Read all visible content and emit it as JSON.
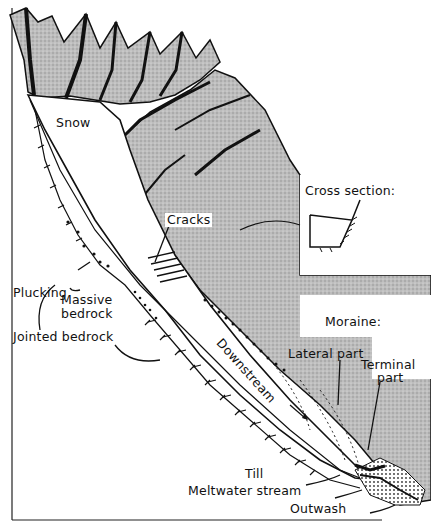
{
  "figure": {
    "colors": {
      "ink": "#111111",
      "rock_fill": "#b8b8b8",
      "rock_dark": "#8a8a8a",
      "snow": "#ffffff",
      "outwash_fill": "#d9d9d9"
    }
  },
  "labels": {
    "snow": "Snow",
    "cross_section": "Cross section:",
    "cracks": "Cracks",
    "plucking": "Plucking",
    "massive_bedrock_1": "Massive",
    "massive_bedrock_2": "bedrock",
    "jointed_bedrock": "Jointed bedrock",
    "moraine": "Moraine:",
    "lateral_part": "Lateral part",
    "terminal_part_1": "Terminal",
    "terminal_part_2": "part",
    "downstream": "Downstream",
    "till": "Till",
    "meltwater_stream": "Meltwater stream",
    "outwash": "Outwash"
  }
}
